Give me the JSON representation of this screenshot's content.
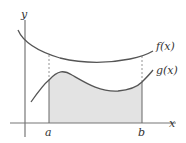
{
  "diagram": {
    "axes": {
      "x_label": "x",
      "y_label": "y"
    },
    "curves": [
      {
        "name": "f",
        "label": "f(x)"
      },
      {
        "name": "g",
        "label": "g(x)"
      }
    ],
    "bounds": {
      "a_label": "a",
      "b_label": "b"
    },
    "shaded_region": "area under g(x) between x=a and x=b",
    "colors": {
      "curve": "#555555",
      "axis": "#777777",
      "fill": "#e3e3e3",
      "dashed": "#888888"
    }
  }
}
